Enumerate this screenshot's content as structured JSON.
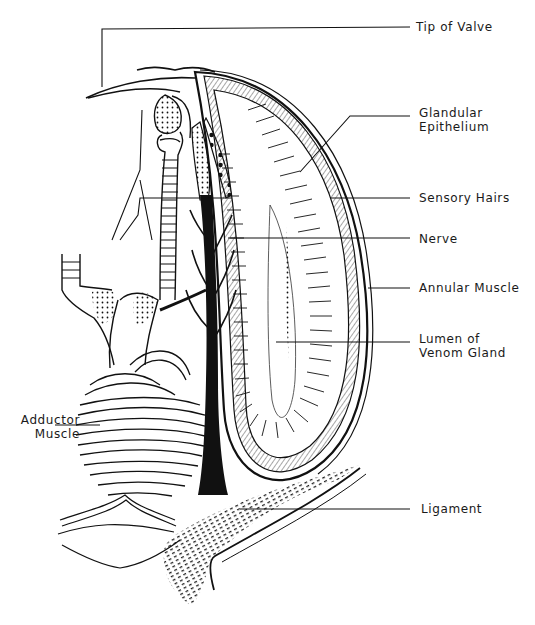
{
  "figure": {
    "ink_color": "#111111",
    "background": "#ffffff"
  },
  "labels": {
    "tip_of_valve": {
      "lines": [
        "Tip of Valve"
      ]
    },
    "glandular_epithelium": {
      "lines": [
        "Glandular",
        "Epithelium"
      ]
    },
    "sensory_hairs": {
      "lines": [
        "Sensory Hairs"
      ]
    },
    "nerve": {
      "lines": [
        "Nerve"
      ]
    },
    "annular_muscle": {
      "lines": [
        "Annular Muscle"
      ]
    },
    "lumen_of_venom_gland": {
      "lines": [
        "Lumen of",
        "Venom Gland"
      ]
    },
    "adductor_muscle": {
      "lines": [
        "Adductor",
        "Muscle"
      ]
    },
    "ligament": {
      "lines": [
        "Ligament"
      ]
    }
  }
}
